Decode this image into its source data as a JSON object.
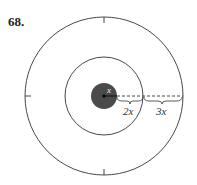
{
  "problem_number": "68.",
  "diagram": {
    "type": "concentric-circles-target",
    "circles": [
      {
        "name": "outer",
        "stroke": "#333333",
        "fill": "none"
      },
      {
        "name": "middle",
        "stroke": "#333333",
        "fill": "none"
      },
      {
        "name": "inner",
        "fill": "#4a4a4a"
      }
    ],
    "labels": {
      "inner_radius": "x",
      "middle_ring_width": "2x",
      "outer_ring_width": "3x"
    },
    "colors": {
      "stroke": "#333333",
      "inner_fill": "#4a4a4a",
      "background": "#ffffff"
    }
  }
}
